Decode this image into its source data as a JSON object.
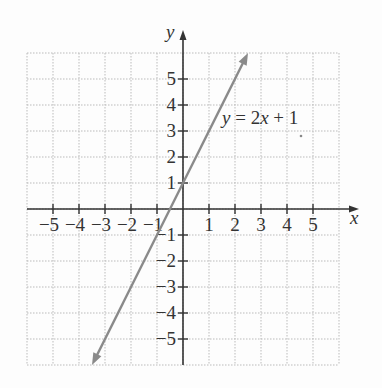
{
  "chart_data": {
    "type": "line",
    "title": "",
    "equation_label": "y = 2x + 1",
    "xlabel": "x",
    "ylabel": "y",
    "xlim": [
      -6,
      6
    ],
    "ylim": [
      -6,
      6
    ],
    "x_ticks": [
      -5,
      -4,
      -3,
      -2,
      -1,
      1,
      2,
      3,
      4,
      5
    ],
    "y_ticks": [
      -5,
      -4,
      -3,
      -2,
      -1,
      1,
      2,
      3,
      4,
      5
    ],
    "grid": true,
    "series": [
      {
        "name": "y = 2x + 1",
        "slope": 2,
        "intercept": 1,
        "x": [
          -3.5,
          2.5
        ],
        "y": [
          -6,
          6
        ],
        "color": "#8a8a8a"
      }
    ]
  },
  "colors": {
    "axis": "#333333",
    "grid": "#bbbbbb",
    "line": "#8a8a8a"
  }
}
